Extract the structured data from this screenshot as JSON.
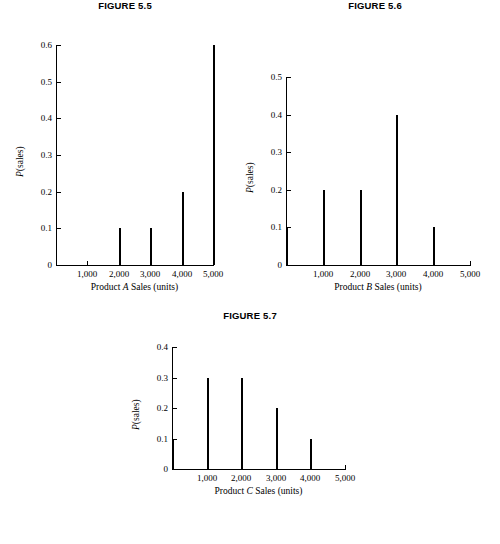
{
  "page": {
    "background_color": "#ffffff",
    "ink_color": "#000000"
  },
  "figures": [
    {
      "title": "FIGURE 5.5",
      "ylabel_prefix": "P",
      "ylabel_suffix": "(sales)",
      "xlabel_prefix": "Product ",
      "xlabel_italic": "A",
      "xlabel_suffix": " Sales (units)",
      "yticks": [
        "0",
        "0.1",
        "0.2",
        "0.3",
        "0.4",
        "0.5",
        "0.6"
      ],
      "xticks": [
        "1,000",
        "2,000",
        "3,000",
        "4,000",
        "5,000"
      ]
    },
    {
      "title": "FIGURE 5.6",
      "ylabel_prefix": "P",
      "ylabel_suffix": "(sales)",
      "xlabel_prefix": "Product ",
      "xlabel_italic": "B",
      "xlabel_suffix": " Sales (units)",
      "yticks": [
        "0",
        "0.1",
        "0.2",
        "0.3",
        "0.4",
        "0.5"
      ],
      "xticks": [
        "1,000",
        "2,000",
        "3,000",
        "4,000",
        "5,000"
      ]
    },
    {
      "title": "FIGURE 5.7",
      "ylabel_prefix": "P",
      "ylabel_suffix": "(sales)",
      "xlabel_prefix": "Product ",
      "xlabel_italic": "C",
      "xlabel_suffix": " Sales (units)",
      "yticks": [
        "0",
        "0.1",
        "0.2",
        "0.3",
        "0.4"
      ],
      "xticks": [
        "1,000",
        "2,000",
        "3,000",
        "4,000",
        "5,000"
      ]
    }
  ],
  "chart_data": [
    {
      "type": "bar",
      "title": "FIGURE 5.5",
      "xlabel": "Product A Sales (units)",
      "ylabel": "P(sales)",
      "categories": [
        0,
        1000,
        2000,
        3000,
        4000,
        5000
      ],
      "tick_labels": [
        "",
        "1,000",
        "2,000",
        "3,000",
        "4,000",
        "5,000"
      ],
      "values": [
        0,
        0,
        0.1,
        0.1,
        0.2,
        0.6
      ],
      "ylim": [
        0,
        0.6
      ],
      "xlim": [
        0,
        5000
      ],
      "yticks": [
        0,
        0.1,
        0.2,
        0.3,
        0.4,
        0.5,
        0.6
      ],
      "grid": false,
      "legend": false
    },
    {
      "type": "bar",
      "title": "FIGURE 5.6",
      "xlabel": "Product B Sales (units)",
      "ylabel": "P(sales)",
      "categories": [
        0,
        1000,
        2000,
        3000,
        4000,
        5000
      ],
      "tick_labels": [
        "",
        "1,000",
        "2,000",
        "3,000",
        "4,000",
        "5,000"
      ],
      "values": [
        0.1,
        0.2,
        0.2,
        0.4,
        0.1,
        0
      ],
      "ylim": [
        0,
        0.5
      ],
      "xlim": [
        0,
        5000
      ],
      "yticks": [
        0,
        0.1,
        0.2,
        0.3,
        0.4,
        0.5
      ],
      "grid": false,
      "legend": false
    },
    {
      "type": "bar",
      "title": "FIGURE 5.7",
      "xlabel": "Product C Sales (units)",
      "ylabel": "P(sales)",
      "categories": [
        0,
        1000,
        2000,
        3000,
        4000,
        5000
      ],
      "tick_labels": [
        "",
        "1,000",
        "2,000",
        "3,000",
        "4,000",
        "5,000"
      ],
      "values": [
        0.1,
        0.3,
        0.3,
        0.2,
        0.1,
        0
      ],
      "ylim": [
        0,
        0.4
      ],
      "xlim": [
        0,
        5000
      ],
      "yticks": [
        0,
        0.1,
        0.2,
        0.3,
        0.4
      ],
      "grid": false,
      "legend": false
    }
  ]
}
